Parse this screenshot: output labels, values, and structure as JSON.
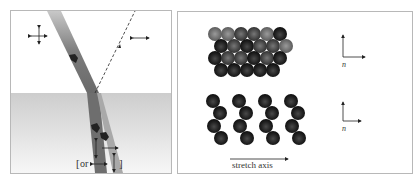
{
  "left_panel": {
    "description": "Light beam refracting through interface; polarization arrows",
    "labels": {
      "bracket_open": "[",
      "or_text": "or",
      "bracket_close": "]"
    },
    "colors": {
      "beam": "#8a8a8a",
      "lower_medium_top": "#cfcfcf",
      "lower_medium_bottom": "#f4f4f4",
      "arrow": "#222222"
    }
  },
  "right_panel": {
    "description": "Molecular packing before and after stretching",
    "axis_labels": {
      "top_n": "n",
      "bottom_n": "n"
    },
    "stretch_axis_label": "stretch axis",
    "colors": {
      "sphere_dark": "#1a1a1a",
      "sphere_mid": "#555555",
      "sphere_light": "#8c8c8c"
    }
  }
}
